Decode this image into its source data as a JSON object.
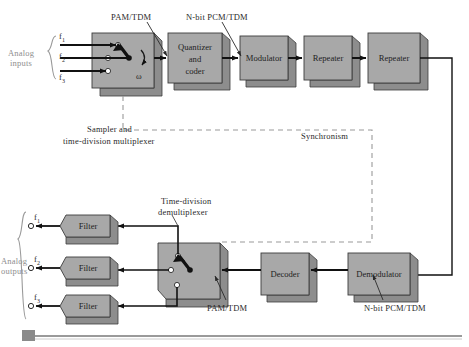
{
  "diagram": {
    "colors": {
      "block_face": "#a8a8a8",
      "block_side": "#8d8d8d",
      "block_stroke": "#3c3c3c",
      "line": "#1a1a1a",
      "dashed": "#9a9a9a",
      "label_gray": "#8e8e8e",
      "label_dark": "#333333",
      "footer_bar": "#9a9a9a",
      "footer_square": "#8a8a8a"
    },
    "transmit_chain": {
      "blocks": [
        {
          "id": "sampler",
          "label": "",
          "x": 92,
          "y": 33,
          "w": 62,
          "h": 55
        },
        {
          "id": "quantizer",
          "label": "Quantizer\nand\ncoder",
          "lines": [
            "Quantizer",
            "and",
            "coder"
          ],
          "x": 168,
          "y": 33,
          "w": 54,
          "h": 50
        },
        {
          "id": "modulator",
          "label": "Modulator",
          "lines": [
            "Modulator"
          ],
          "x": 240,
          "y": 36,
          "w": 48,
          "h": 44
        },
        {
          "id": "repeater1",
          "label": "Repeater",
          "lines": [
            "Repeater"
          ],
          "x": 304,
          "y": 36,
          "w": 48,
          "h": 44
        },
        {
          "id": "repeater2",
          "label": "Repeater",
          "lines": [
            "Repeater"
          ],
          "x": 368,
          "y": 33,
          "w": 52,
          "h": 50
        }
      ],
      "switch_symbol": "ω",
      "input_group_label_line1": "Analog",
      "input_group_label_line2": "inputs",
      "inputs": [
        {
          "name": "f",
          "sub": "1"
        },
        {
          "name": "f",
          "sub": "2"
        },
        {
          "name": "f",
          "sub": "3"
        }
      ],
      "caption_line1": "Sampler and",
      "caption_line2": "time-division multiplexer",
      "annotation_pam": "PAM/TDM",
      "annotation_pcm": "N-bit PCM/TDM"
    },
    "sync": {
      "label": "Synchronism"
    },
    "receive_chain": {
      "blocks": [
        {
          "id": "demux",
          "label": "",
          "x": 158,
          "y": 243,
          "w": 62,
          "h": 56
        },
        {
          "id": "decoder",
          "label": "Decoder",
          "lines": [
            "Decoder"
          ],
          "x": 261,
          "y": 253,
          "w": 48,
          "h": 42
        },
        {
          "id": "demodulator",
          "label": "Demodulator",
          "lines": [
            "Demodulator"
          ],
          "x": 348,
          "y": 253,
          "w": 62,
          "h": 42
        }
      ],
      "filters": [
        {
          "id": "filter1",
          "label": "Filter",
          "x": 60,
          "y": 215,
          "w": 50,
          "h": 22
        },
        {
          "id": "filter2",
          "label": "Filter",
          "x": 60,
          "y": 257,
          "w": 50,
          "h": 22
        },
        {
          "id": "filter3",
          "label": "Filter",
          "x": 60,
          "y": 295,
          "w": 50,
          "h": 22
        }
      ],
      "output_group_label_line1": "Analog",
      "output_group_label_line2": "outputs",
      "outputs": [
        {
          "name": "f",
          "sub": "1"
        },
        {
          "name": "f",
          "sub": "2"
        },
        {
          "name": "f",
          "sub": "3"
        }
      ],
      "caption_line1": "Time-division",
      "caption_line2": "demultiplexer",
      "annotation_pam": "PAM/TDM",
      "annotation_pcm": "N-bit PCM/TDM"
    },
    "footer": {
      "bar_present": true,
      "square_present": true
    }
  }
}
